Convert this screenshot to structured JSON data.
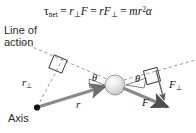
{
  "figure": {
    "background_color": "#ffffff",
    "arrow_color": "#7b7b7b",
    "dash_color": "#8d8d8d",
    "ink_color": "#1a1a1a"
  },
  "equation": {
    "tau": "τ",
    "tau_subscript": "net",
    "equals_1": "=",
    "term1_var": "r",
    "term1_perp": "⊥",
    "term1_force": "F",
    "equals_2": "=",
    "term2_var": "r",
    "term2_force": "F",
    "term2_perp": "⊥",
    "equals_3": "=",
    "term3_m": "m",
    "term3_r": "r",
    "term3_exp": "2",
    "term3_alpha": "α",
    "plain_text": "τnet = r⊥F = rF⊥ = mr²α"
  },
  "labels": {
    "line_of_action_1": "Line of",
    "line_of_action_2": "action",
    "axis": "Axis",
    "r_perp_var": "r",
    "r_perp_sub": "⊥",
    "r_var": "r",
    "f_var": "F",
    "f_perp_var": "F",
    "f_perp_sub": "⊥",
    "theta_left": "θ",
    "theta_right": "θ"
  },
  "geometry": {
    "axis_point": [
      37,
      108
    ],
    "mass_center": [
      115,
      85
    ],
    "mass_radius": 10,
    "r_vector_from": [
      37,
      108
    ],
    "r_vector_to": [
      104,
      86
    ],
    "f_vector_from": [
      122,
      88
    ],
    "f_vector_to": [
      168,
      107
    ],
    "line_of_action_from": [
      22,
      43
    ],
    "line_of_action_to": [
      196,
      62
    ],
    "r_perp_from": [
      37,
      108
    ],
    "r_perp_to": [
      61,
      57
    ],
    "f_perp_from": [
      152,
      70
    ],
    "f_perp_to": [
      163,
      98
    ],
    "right_angle_left_center": [
      58,
      64
    ],
    "right_angle_right_center": [
      152,
      76
    ]
  }
}
